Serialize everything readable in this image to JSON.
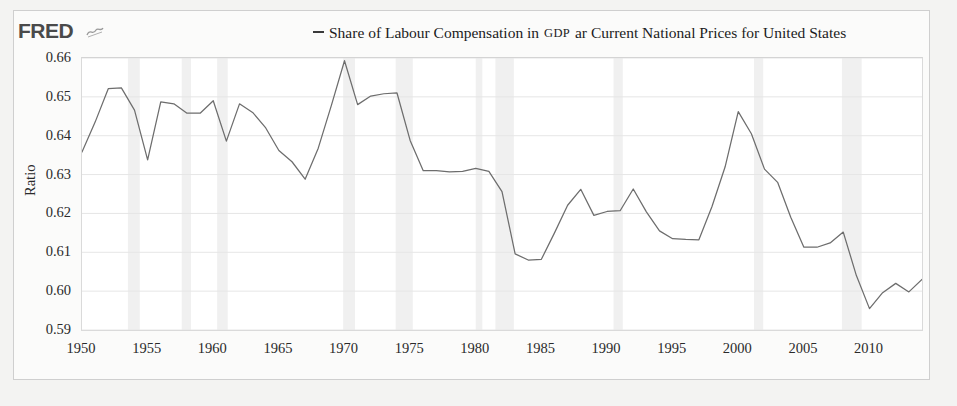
{
  "brand": {
    "logo_text": "FRED",
    "logo_icon": "squiggle-line-icon"
  },
  "legend": {
    "marker": "line-dash-marker",
    "text_part1": "Share of Labour Compensation in ",
    "text_smallcaps": "GDP",
    "text_part2": " ar Current National Prices for United States",
    "full_text": "Share of Labour Compensation in GDP ar Current National Prices for United States"
  },
  "colors": {
    "line": "#6d6d6d",
    "grid": "#e6e6e6",
    "recession_band": "#f0f0f0",
    "plot_bg": "#ffffff",
    "card_bg": "#fbfbfa",
    "page_bg": "#f3f3f2",
    "text": "#2a2a2a"
  },
  "chart_data": {
    "type": "line",
    "title": "",
    "xlabel": "",
    "ylabel": "Ratio",
    "ylim": [
      0.59,
      0.66
    ],
    "xlim": [
      1950,
      2014
    ],
    "grid": true,
    "legend_position": "top",
    "ytick_labels": [
      "0.66",
      "0.65",
      "0.64",
      "0.63",
      "0.62",
      "0.61",
      "0.60",
      "0.59"
    ],
    "yticks": [
      0.66,
      0.65,
      0.64,
      0.63,
      0.62,
      0.61,
      0.6,
      0.59
    ],
    "xtick_labels": [
      "1950",
      "1955",
      "1960",
      "1965",
      "1970",
      "1975",
      "1980",
      "1985",
      "1990",
      "1995",
      "2000",
      "2005",
      "2010"
    ],
    "xticks": [
      1950,
      1955,
      1960,
      1965,
      1970,
      1975,
      1980,
      1985,
      1990,
      1995,
      2000,
      2005,
      2010
    ],
    "series": [
      {
        "name": "Share of Labour Compensation in GDP ar Current National Prices for United States",
        "x": [
          1950,
          1951,
          1952,
          1953,
          1954,
          1955,
          1956,
          1957,
          1958,
          1959,
          1960,
          1961,
          1962,
          1963,
          1964,
          1965,
          1966,
          1967,
          1968,
          1969,
          1970,
          1971,
          1972,
          1973,
          1974,
          1975,
          1976,
          1977,
          1978,
          1979,
          1980,
          1981,
          1982,
          1983,
          1984,
          1985,
          1986,
          1987,
          1988,
          1989,
          1990,
          1991,
          1992,
          1993,
          1994,
          1995,
          1996,
          1997,
          1998,
          1999,
          2000,
          2001,
          2002,
          2003,
          2004,
          2005,
          2006,
          2007,
          2008,
          2009,
          2010,
          2011,
          2012,
          2013,
          2014
        ],
        "values": [
          0.6358,
          0.6435,
          0.6521,
          0.6523,
          0.6466,
          0.6338,
          0.6487,
          0.6482,
          0.6458,
          0.6458,
          0.649,
          0.6386,
          0.6482,
          0.646,
          0.642,
          0.6362,
          0.6333,
          0.6288,
          0.6368,
          0.6478,
          0.6593,
          0.648,
          0.6502,
          0.6508,
          0.651,
          0.6388,
          0.631,
          0.631,
          0.6307,
          0.6308,
          0.6316,
          0.6308,
          0.6256,
          0.6096,
          0.608,
          0.6082,
          0.615,
          0.6221,
          0.6262,
          0.6195,
          0.6205,
          0.6207,
          0.6263,
          0.6204,
          0.6155,
          0.6135,
          0.6133,
          0.6132,
          0.6218,
          0.632,
          0.6462,
          0.6405,
          0.6314,
          0.628,
          0.619,
          0.6113,
          0.6113,
          0.6124,
          0.6152,
          0.604,
          0.5955,
          0.5996,
          0.602,
          0.5998,
          0.603
        ]
      }
    ],
    "recession_bands": [
      [
        1953.5,
        1954.4
      ],
      [
        1957.6,
        1958.3
      ],
      [
        1960.3,
        1961.1
      ],
      [
        1969.9,
        1970.8
      ],
      [
        1973.9,
        1975.2
      ],
      [
        1980.0,
        1980.5
      ],
      [
        1981.5,
        1982.9
      ],
      [
        1990.5,
        1991.2
      ],
      [
        2001.2,
        2001.9
      ],
      [
        2007.9,
        2009.4
      ]
    ]
  }
}
